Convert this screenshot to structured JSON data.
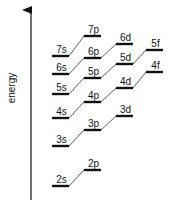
{
  "diagram": {
    "title": "",
    "axis": {
      "label": "energy",
      "direction": "up",
      "x": 31,
      "y_top": 10,
      "y_bottom": 200
    },
    "colors": {
      "line": "#111111",
      "connector": "#333333",
      "background": "#ffffff"
    },
    "columns": {
      "s": {
        "x1": 52,
        "x2": 69
      },
      "p": {
        "x1": 84,
        "x2": 101
      },
      "d": {
        "x1": 116,
        "x2": 133
      },
      "f": {
        "x1": 146,
        "x2": 163
      }
    },
    "levels": [
      {
        "id": "2s",
        "label": "2s",
        "type": "s",
        "y": 186
      },
      {
        "id": "2p",
        "label": "2p",
        "type": "p",
        "y": 170
      },
      {
        "id": "3s",
        "label": "3s",
        "type": "s",
        "y": 146
      },
      {
        "id": "3p",
        "label": "3p",
        "type": "p",
        "y": 130
      },
      {
        "id": "3d",
        "label": "3d",
        "type": "d",
        "y": 116
      },
      {
        "id": "4s",
        "label": "4s",
        "type": "s",
        "y": 118
      },
      {
        "id": "4p",
        "label": "4p",
        "type": "p",
        "y": 102
      },
      {
        "id": "4d",
        "label": "4d",
        "type": "d",
        "y": 88
      },
      {
        "id": "4f",
        "label": "4f",
        "type": "f",
        "y": 72
      },
      {
        "id": "5s",
        "label": "5s",
        "type": "s",
        "y": 94
      },
      {
        "id": "5p",
        "label": "5p",
        "type": "p",
        "y": 78
      },
      {
        "id": "5d",
        "label": "5d",
        "type": "d",
        "y": 64
      },
      {
        "id": "5f",
        "label": "5f",
        "type": "f",
        "y": 50
      },
      {
        "id": "6s",
        "label": "6s",
        "type": "s",
        "y": 74
      },
      {
        "id": "6p",
        "label": "6p",
        "type": "p",
        "y": 58
      },
      {
        "id": "6d",
        "label": "6d",
        "type": "d",
        "y": 44
      },
      {
        "id": "7s",
        "label": "7s",
        "type": "s",
        "y": 56
      },
      {
        "id": "7p",
        "label": "7p",
        "type": "p",
        "y": 36
      }
    ],
    "connections": [
      [
        "2s",
        "2p"
      ],
      [
        "3s",
        "3p"
      ],
      [
        "3p",
        "3d"
      ],
      [
        "4s",
        "4p"
      ],
      [
        "4p",
        "4d"
      ],
      [
        "4d",
        "4f"
      ],
      [
        "5s",
        "5p"
      ],
      [
        "5p",
        "5d"
      ],
      [
        "5d",
        "5f"
      ],
      [
        "6s",
        "6p"
      ],
      [
        "6p",
        "6d"
      ],
      [
        "7s",
        "7p"
      ]
    ]
  }
}
